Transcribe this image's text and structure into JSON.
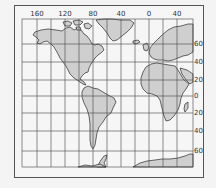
{
  "map": {
    "projection": "Mercator",
    "longitude_labels": [
      "160",
      "120",
      "80",
      "40",
      "0",
      "40"
    ],
    "latitude_labels": [
      "60",
      "40",
      "20",
      "0",
      "20",
      "40",
      "60"
    ],
    "colors": {
      "land": "#cfcfcf",
      "water": "#f6f6f6",
      "grid": "#444444",
      "coastline": "#2a2a2a"
    },
    "continents": [
      "North America",
      "Greenland",
      "South America",
      "Europe",
      "Africa",
      "Antarctica"
    ]
  }
}
